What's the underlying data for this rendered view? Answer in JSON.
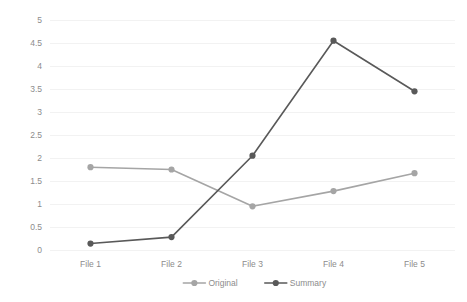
{
  "chart_data": {
    "type": "line",
    "title": "",
    "xlabel": "",
    "ylabel": "",
    "categories": [
      "File 1",
      "File 2",
      "File 3",
      "File 4",
      "File 5"
    ],
    "series": [
      {
        "name": "Original",
        "color": "#a5a5a5",
        "values": [
          1.8,
          1.75,
          0.95,
          1.28,
          1.67
        ]
      },
      {
        "name": "Summary",
        "color": "#595959",
        "values": [
          0.14,
          0.28,
          2.05,
          4.55,
          3.45
        ]
      }
    ],
    "ylim": [
      0,
      5
    ],
    "ytick_step": 0.5,
    "ytick_labels": [
      "0",
      "0.5",
      "1",
      "1.5",
      "2",
      "2.5",
      "3",
      "3.5",
      "4",
      "4.5",
      "5"
    ],
    "ytick_values": [
      0,
      0.5,
      1,
      1.5,
      2,
      2.5,
      3,
      3.5,
      4,
      4.5,
      5
    ],
    "grid": true,
    "grid_orientation": "horizontal",
    "legend_position": "bottom",
    "legend_entries": [
      "Original",
      "Summary"
    ],
    "marker": "circle",
    "background_color": "#ffffff",
    "gridline_color": "#f2f2f2",
    "text_color": "#8c8c8c"
  }
}
